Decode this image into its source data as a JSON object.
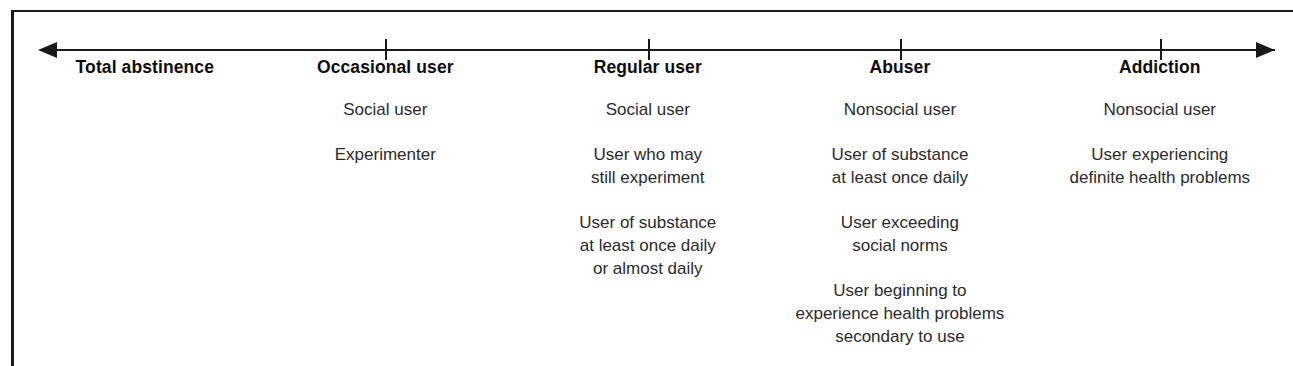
{
  "figure": {
    "kind": "continuum-diagram",
    "axis": {
      "left_arrow_icon": "arrow-left-icon",
      "right_arrow_icon": "arrow-right-icon",
      "tick_count": 4
    }
  },
  "columns": [
    {
      "heading": "Total abstinence",
      "center_pct": 11.2,
      "tick": false,
      "entries": []
    },
    {
      "heading": "Occasional user",
      "center_pct": 29.8,
      "tick": true,
      "entries": [
        {
          "lines": [
            "Social user"
          ]
        },
        {
          "lines": [
            "Experimenter"
          ]
        }
      ]
    },
    {
      "heading": "Regular user",
      "center_pct": 50.1,
      "tick": true,
      "entries": [
        {
          "lines": [
            "Social user"
          ]
        },
        {
          "lines": [
            "User who may",
            "still experiment"
          ]
        },
        {
          "lines": [
            "User of substance",
            "at least once daily",
            "or almost daily"
          ]
        }
      ]
    },
    {
      "heading": "Abuser",
      "center_pct": 69.6,
      "tick": true,
      "entries": [
        {
          "lines": [
            "Nonsocial user"
          ]
        },
        {
          "lines": [
            "User of substance",
            "at least once daily"
          ]
        },
        {
          "lines": [
            "User exceeding",
            "social norms"
          ]
        },
        {
          "lines": [
            "User beginning to",
            "experience health problems",
            "secondary to use"
          ]
        }
      ]
    },
    {
      "heading": "Addiction",
      "center_pct": 89.7,
      "tick": true,
      "entries": [
        {
          "lines": [
            "Nonsocial user"
          ]
        },
        {
          "lines": [
            "User experiencing",
            "definite health problems"
          ]
        }
      ]
    }
  ],
  "colors": {
    "ink": "#1a1a1a",
    "body_ink": "#2b2b2b",
    "paper": "#ffffff"
  }
}
